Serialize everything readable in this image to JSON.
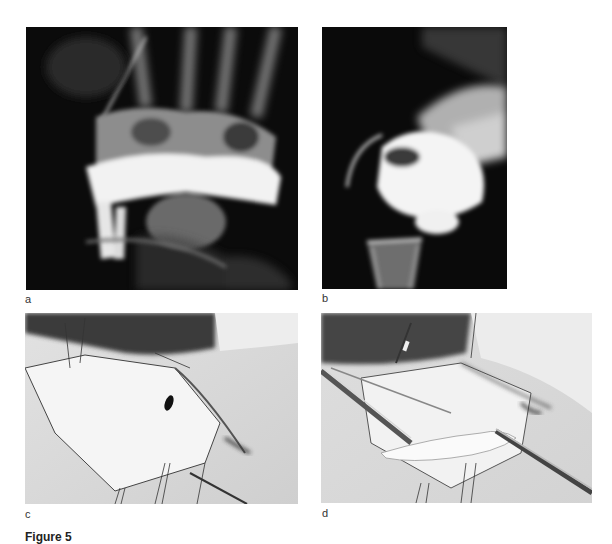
{
  "figure": {
    "panels": [
      {
        "id": "a",
        "label": "a",
        "description": "X-ray, posteroanterior view of wrist with contrast in carpal region"
      },
      {
        "id": "b",
        "label": "b",
        "description": "X-ray, lateral view of wrist"
      },
      {
        "id": "c",
        "label": "c",
        "description": "Intraoperative photo, dorsal wrist incision with sutured flaps"
      },
      {
        "id": "d",
        "label": "d",
        "description": "Intraoperative photo, tendon/graft isolated with instruments"
      }
    ],
    "caption_visible": "Figure 5"
  }
}
